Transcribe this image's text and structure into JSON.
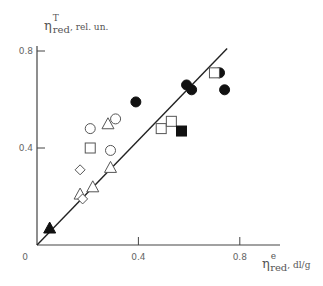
{
  "chart_data": {
    "type": "scatter",
    "title": "",
    "xlabel": "η_red^e, dl/g",
    "ylabel": "η_red^T, rel. un.",
    "xlabel_parts": {
      "symbol": "η",
      "sup": "e",
      "sub": "red",
      "unit": ", dl/g"
    },
    "ylabel_parts": {
      "symbol": "η",
      "sup": "T",
      "sub": "red",
      "unit": ", rel. un."
    },
    "xlim": [
      0,
      0.95
    ],
    "ylim": [
      0,
      0.83
    ],
    "x_ticks": [
      {
        "value": 0.4,
        "label": "0.4"
      },
      {
        "value": 0.8,
        "label": "0.8"
      }
    ],
    "y_ticks": [
      {
        "value": 0.4,
        "label": "0.4"
      },
      {
        "value": 0.8,
        "label": "0.8"
      }
    ],
    "origin_label": "0",
    "grid": false,
    "legend": null,
    "reference_line": {
      "x": [
        0,
        0.75
      ],
      "y": [
        0,
        0.81
      ],
      "description": "y = x"
    },
    "series": [
      {
        "name": "open circles",
        "marker": "circle",
        "filled": false,
        "points": [
          [
            0.21,
            0.48
          ],
          [
            0.31,
            0.52
          ],
          [
            0.29,
            0.39
          ]
        ]
      },
      {
        "name": "filled circles",
        "marker": "circle",
        "filled": true,
        "points": [
          [
            0.39,
            0.59
          ],
          [
            0.59,
            0.66
          ],
          [
            0.61,
            0.64
          ],
          [
            0.72,
            0.71
          ],
          [
            0.74,
            0.64
          ]
        ]
      },
      {
        "name": "open squares",
        "marker": "square",
        "filled": false,
        "points": [
          [
            0.21,
            0.4
          ],
          [
            0.49,
            0.48
          ],
          [
            0.53,
            0.51
          ],
          [
            0.7,
            0.71
          ]
        ]
      },
      {
        "name": "filled squares",
        "marker": "square",
        "filled": true,
        "points": [
          [
            0.57,
            0.47
          ]
        ]
      },
      {
        "name": "open triangles",
        "marker": "triangle",
        "filled": false,
        "points": [
          [
            0.28,
            0.5
          ],
          [
            0.29,
            0.32
          ],
          [
            0.22,
            0.24
          ],
          [
            0.17,
            0.21
          ]
        ]
      },
      {
        "name": "filled triangles",
        "marker": "triangle",
        "filled": true,
        "points": [
          [
            0.05,
            0.07
          ]
        ]
      },
      {
        "name": "open diamonds",
        "marker": "diamond",
        "filled": false,
        "points": [
          [
            0.17,
            0.31
          ],
          [
            0.18,
            0.19
          ]
        ]
      }
    ]
  }
}
